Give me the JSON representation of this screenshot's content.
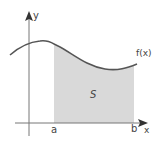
{
  "diagram": {
    "axes": {
      "x_label": "x",
      "y_label": "y"
    },
    "curve": {
      "label": "f(x)"
    },
    "region": {
      "label": "S",
      "fill_color": "#d9d9d9"
    },
    "bounds": {
      "lower_label": "a",
      "upper_label": "b"
    },
    "colors": {
      "curve": "#555555",
      "axis": "#777777",
      "text": "#444444",
      "background": "#ffffff"
    }
  }
}
